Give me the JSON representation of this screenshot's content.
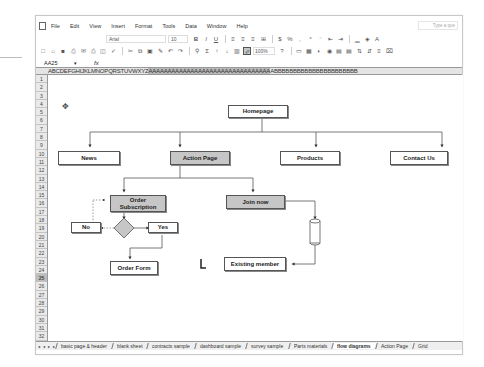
{
  "window": {
    "menu": [
      "File",
      "Edit",
      "View",
      "Insert",
      "Format",
      "Tools",
      "Data",
      "Window",
      "Help"
    ],
    "ask_placeholder": "Type a que",
    "formatting": {
      "font": "Arial",
      "size": "10",
      "zoom": "100%"
    },
    "name_box": "AA25",
    "formula_fx": "fx",
    "formula_value": ""
  },
  "column_headers": "ABCDEFGHIJKLMNOPQRSTUVWXYZ",
  "column_headers_selected": "AAAAAAAAAAAAAAAAAAAAAAAAAAAAAAAA",
  "column_headers_tail": "ABBBBBBBBBBBBBBBBBBBBBB",
  "rows": [
    "1",
    "2",
    "3",
    "4",
    "5",
    "6",
    "7",
    "8",
    "9",
    "10",
    "11",
    "12",
    "13",
    "14",
    "15",
    "16",
    "17",
    "18",
    "19",
    "20",
    "21",
    "22",
    "23",
    "24",
    "25",
    "26",
    "27",
    "28",
    "29",
    "30",
    "31",
    "32"
  ],
  "selected_row": "25",
  "diagram": {
    "nodes": {
      "homepage": "Homepage",
      "news": "News",
      "action_page": "Action Page",
      "products": "Products",
      "contact_us": "Contact Us",
      "order_subscription": "Order Subscription",
      "join_now": "Join now",
      "no": "No",
      "yes": "Yes",
      "order_form": "Order Form",
      "existing_member": "Existing member"
    },
    "colors": {
      "highlight_fill": "#c6c6c6",
      "line": "#555555"
    }
  },
  "sheet_tabs": [
    {
      "label": "basic page & header",
      "active": false
    },
    {
      "label": "blank sheet",
      "active": false
    },
    {
      "label": "contracts sample",
      "active": false
    },
    {
      "label": "dashboard sample",
      "active": false
    },
    {
      "label": "survey sample",
      "active": false
    },
    {
      "label": "Parts materials",
      "active": false
    },
    {
      "label": "flow diagrams",
      "active": true
    },
    {
      "label": "Action Page",
      "active": false
    },
    {
      "label": "Grid",
      "active": false
    }
  ],
  "tab_nav": "◂ ◂ ▸ ▸"
}
